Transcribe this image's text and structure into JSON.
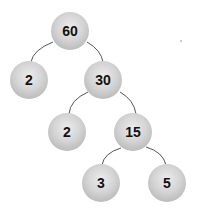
{
  "diagram": {
    "type": "factor-tree",
    "nodes": [
      {
        "id": "n60",
        "label": "60",
        "x": 70,
        "y": 31
      },
      {
        "id": "n2a",
        "label": "2",
        "x": 29,
        "y": 80
      },
      {
        "id": "n30",
        "label": "30",
        "x": 103,
        "y": 80
      },
      {
        "id": "n2b",
        "label": "2",
        "x": 67,
        "y": 132
      },
      {
        "id": "n15",
        "label": "15",
        "x": 133,
        "y": 132
      },
      {
        "id": "n3",
        "label": "3",
        "x": 101,
        "y": 183
      },
      {
        "id": "n5",
        "label": "5",
        "x": 167,
        "y": 183
      }
    ],
    "edges": [
      [
        "n60",
        "n2a"
      ],
      [
        "n60",
        "n30"
      ],
      [
        "n30",
        "n2b"
      ],
      [
        "n30",
        "n15"
      ],
      [
        "n15",
        "n3"
      ],
      [
        "n15",
        "n5"
      ]
    ],
    "colors": {
      "node_light": "#ececec",
      "node_dark": "#a9a9a9",
      "edge": "#555555",
      "text": "#111111"
    }
  }
}
